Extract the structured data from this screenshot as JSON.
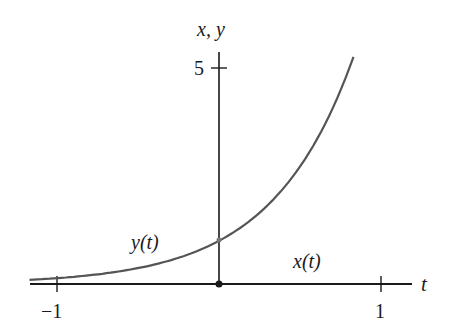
{
  "chart_data": {
    "type": "line",
    "title": "",
    "xlabel": "t",
    "ylabel": "x, y",
    "xlim": [
      -1.17,
      1.25
    ],
    "ylim": [
      0,
      6.5
    ],
    "x_ticks": [
      -1,
      1
    ],
    "x_tick_labels": [
      "−1",
      "1"
    ],
    "y_ticks": [
      5
    ],
    "y_tick_labels": [
      "5"
    ],
    "grid": false,
    "legend": "none",
    "series": [
      {
        "name": "y(t)",
        "formula": "y = e^(2t)",
        "x": [
          -1.17,
          -1.0,
          -0.75,
          -0.5,
          -0.25,
          0.0,
          0.25,
          0.5,
          0.75,
          0.83
        ],
        "values": [
          0.1,
          0.14,
          0.22,
          0.37,
          0.61,
          1.0,
          1.65,
          2.72,
          4.48,
          5.26
        ]
      },
      {
        "name": "x(t)",
        "formula": "x = 0",
        "x": [
          -1.17,
          1.0
        ],
        "values": [
          0,
          0
        ]
      }
    ],
    "annotations": [
      {
        "text": "y(t)",
        "near": [
          -0.55,
          0.85
        ]
      },
      {
        "text": "x(t)",
        "near": [
          0.5,
          0.45
        ]
      },
      {
        "text": "origin dot",
        "at": [
          0,
          0
        ]
      },
      {
        "text": "intercept point",
        "at": [
          0,
          1
        ]
      }
    ]
  },
  "labels": {
    "y_axis": "x, y",
    "x_axis": "t",
    "tick_y5": "5",
    "tick_xm1": "−1",
    "tick_x1": "1",
    "curve_y": "y(t)",
    "curve_x": "x(t)"
  }
}
